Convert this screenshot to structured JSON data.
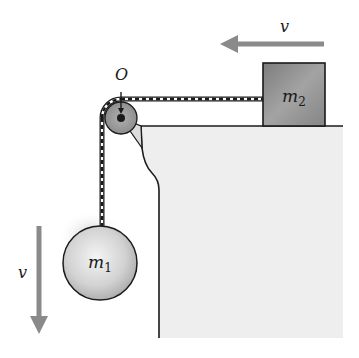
{
  "diagram": {
    "type": "pulley-system",
    "labels": {
      "pivot": "O",
      "mass_hanging": "m",
      "mass_hanging_sub": "1",
      "mass_block": "m",
      "mass_block_sub": "2",
      "velocity_block": "v",
      "velocity_hanging": "v"
    },
    "colors": {
      "arrow": "#8a8a8a",
      "table_fill": "#eeeeee",
      "outline": "#1a1a1a",
      "pulley": "#9a9a9a",
      "block": "#8c8c8c",
      "sphere_light": "#f2f2f2",
      "sphere_dark": "#a8a8a8"
    },
    "elements": [
      {
        "id": "table",
        "description": "Table with curved edge bracket"
      },
      {
        "id": "pulley",
        "description": "Pulley at corner O"
      },
      {
        "id": "rope",
        "description": "Rope over pulley connecting m1 and m2"
      },
      {
        "id": "block_m2",
        "description": "Block m2 on table moving left with velocity v"
      },
      {
        "id": "sphere_m1",
        "description": "Hanging sphere m1 moving down with velocity v"
      }
    ]
  }
}
